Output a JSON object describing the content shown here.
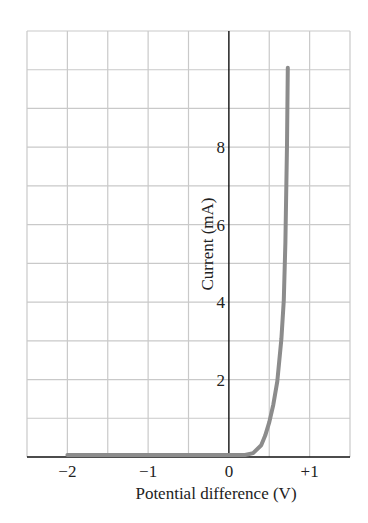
{
  "chart_data": {
    "type": "line",
    "title": "",
    "xlabel": "Potential difference (V)",
    "ylabel": "Current (mA)",
    "xlim": [
      -2.5,
      1.5
    ],
    "ylim": [
      0,
      11
    ],
    "x_ticks": [
      {
        "value": -2,
        "label": "−2"
      },
      {
        "value": -1,
        "label": "−1"
      },
      {
        "value": 0,
        "label": "0"
      },
      {
        "value": 1,
        "label": "+1"
      }
    ],
    "y_ticks": [
      {
        "value": 2,
        "label": "2"
      },
      {
        "value": 4,
        "label": "4"
      },
      {
        "value": 6,
        "label": "6"
      },
      {
        "value": 8,
        "label": "8"
      }
    ],
    "grid": true,
    "grid_x_step": 0.5,
    "grid_y_step": 1,
    "legend": null,
    "series": [
      {
        "name": "Diode I-V characteristic",
        "x": [
          -2.0,
          -1.0,
          0.0,
          0.2,
          0.3,
          0.4,
          0.45,
          0.5,
          0.55,
          0.6,
          0.65,
          0.68,
          0.7,
          0.72,
          0.73
        ],
        "y": [
          0.0,
          0.0,
          0.0,
          0.0,
          0.05,
          0.25,
          0.5,
          0.85,
          1.3,
          1.9,
          3.0,
          4.0,
          5.5,
          8.0,
          10.0
        ]
      }
    ],
    "colors": {
      "curve": "#8c8c8c",
      "grid": "#c9c9c9",
      "axis": "#111111",
      "text": "#222222"
    }
  }
}
